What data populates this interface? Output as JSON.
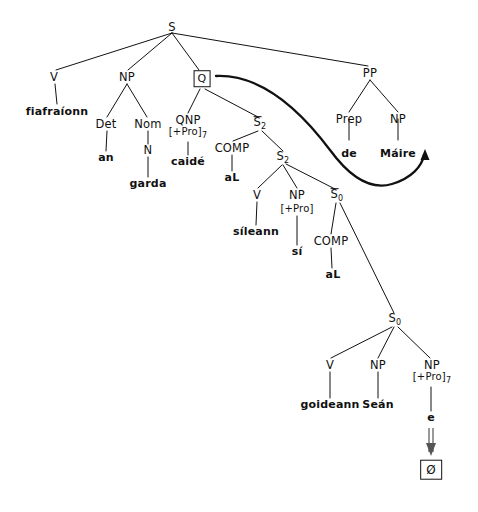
{
  "figure": {
    "type": "syntax-tree-diagram",
    "language": "Irish",
    "background_color": "#ffffff",
    "ink_color": "#111111",
    "width": 478,
    "height": 512
  },
  "nodes": {
    "root_s": {
      "label": "S",
      "x": 172,
      "y": 27
    },
    "v_top": {
      "label": "V",
      "x": 54,
      "y": 77
    },
    "fiafraionn": {
      "label": "fiafraíonn",
      "x": 57,
      "y": 112
    },
    "np_subj": {
      "label": "NP",
      "x": 127,
      "y": 77
    },
    "det": {
      "label": "Det",
      "x": 106,
      "y": 124
    },
    "an": {
      "label": "an",
      "x": 106,
      "y": 158
    },
    "nom": {
      "label": "Nom",
      "x": 148,
      "y": 124
    },
    "n": {
      "label": "N",
      "x": 148,
      "y": 150
    },
    "garda": {
      "label": "garda",
      "x": 148,
      "y": 184
    },
    "q_box": {
      "label": "Q",
      "x": 202,
      "y": 79
    },
    "qnp": {
      "label": "QNP",
      "x": 188,
      "y": 120
    },
    "qnp_feat": {
      "label": "[+Pro]",
      "index": "7",
      "x": 188,
      "y": 134
    },
    "caide": {
      "label": "caidé",
      "x": 188,
      "y": 162
    },
    "sbar2_upper": {
      "label": "S",
      "sub": "2",
      "overbar": true,
      "x": 260,
      "y": 124
    },
    "comp_upper": {
      "label": "COMP",
      "x": 232,
      "y": 148
    },
    "al_upper": {
      "label": "aL",
      "x": 232,
      "y": 178
    },
    "s2": {
      "label": "S",
      "sub": "2",
      "x": 283,
      "y": 158
    },
    "v_mid": {
      "label": "V",
      "x": 257,
      "y": 195
    },
    "sileann": {
      "label": "síleann",
      "x": 256,
      "y": 232
    },
    "np_si": {
      "label": "NP",
      "x": 297,
      "y": 195
    },
    "np_si_feat": {
      "label": "[+Pro]",
      "x": 297,
      "y": 209
    },
    "si": {
      "label": "sí",
      "x": 297,
      "y": 252
    },
    "sbar0": {
      "label": "S",
      "sub": "0",
      "overbar": true,
      "x": 337,
      "y": 196
    },
    "comp_lower": {
      "label": "COMP",
      "x": 331,
      "y": 241
    },
    "al_lower": {
      "label": "aL",
      "x": 333,
      "y": 275
    },
    "s0": {
      "label": "S",
      "sub": "0",
      "x": 395,
      "y": 320
    },
    "v_low": {
      "label": "V",
      "x": 330,
      "y": 365
    },
    "goideann": {
      "label": "goideann",
      "x": 330,
      "y": 405
    },
    "np_sean": {
      "label": "NP",
      "x": 378,
      "y": 365
    },
    "sean": {
      "label": "Seán",
      "x": 378,
      "y": 405
    },
    "np_trace": {
      "label": "NP",
      "x": 432,
      "y": 365
    },
    "np_trace_feat": {
      "label": "[+Pro]",
      "index": "7",
      "x": 432,
      "y": 379
    },
    "e_trace": {
      "label": "e",
      "x": 431,
      "y": 418
    },
    "null_box": {
      "label": "Ø",
      "x": 431,
      "y": 470
    }
  },
  "edges": [
    {
      "name": "s-to-v",
      "from": [
        172,
        33
      ],
      "to": [
        56,
        70
      ]
    },
    {
      "name": "s-to-np",
      "from": [
        172,
        33
      ],
      "to": [
        128,
        70
      ]
    },
    {
      "name": "s-to-q",
      "from": [
        172,
        33
      ],
      "to": [
        199,
        70
      ]
    },
    {
      "name": "s-to-pp",
      "from": [
        172,
        33
      ],
      "to": [
        368,
        66
      ]
    },
    {
      "name": "v-to-fiafraionn",
      "from": [
        55,
        84
      ],
      "to": [
        57,
        104
      ]
    },
    {
      "name": "np-to-det",
      "from": [
        127,
        84
      ],
      "to": [
        107,
        117
      ]
    },
    {
      "name": "np-to-nom",
      "from": [
        127,
        84
      ],
      "to": [
        147,
        117
      ]
    },
    {
      "name": "det-to-an",
      "from": [
        107,
        131
      ],
      "to": [
        106,
        151
      ]
    },
    {
      "name": "nom-to-n",
      "from": [
        148,
        131
      ],
      "to": [
        148,
        144
      ]
    },
    {
      "name": "n-to-garda",
      "from": [
        148,
        157
      ],
      "to": [
        148,
        177
      ]
    },
    {
      "name": "q-to-qnp",
      "from": [
        200,
        89
      ],
      "to": [
        188,
        113
      ]
    },
    {
      "name": "q-to-sbar2",
      "from": [
        205,
        89
      ],
      "to": [
        258,
        117
      ]
    },
    {
      "name": "qnp-to-caide",
      "from": [
        188,
        142
      ],
      "to": [
        188,
        155
      ]
    },
    {
      "name": "sbar2-to-comp",
      "from": [
        258,
        131
      ],
      "to": [
        233,
        141
      ]
    },
    {
      "name": "sbar2-to-s2",
      "from": [
        262,
        131
      ],
      "to": [
        283,
        151
      ]
    },
    {
      "name": "comp-to-al",
      "from": [
        232,
        155
      ],
      "to": [
        232,
        171
      ]
    },
    {
      "name": "s2-to-v",
      "from": [
        282,
        165
      ],
      "to": [
        258,
        188
      ]
    },
    {
      "name": "s2-to-np",
      "from": [
        283,
        165
      ],
      "to": [
        297,
        188
      ]
    },
    {
      "name": "s2-to-sbar0",
      "from": [
        286,
        164
      ],
      "to": [
        335,
        189
      ]
    },
    {
      "name": "v-to-sileann",
      "from": [
        257,
        202
      ],
      "to": [
        256,
        225
      ]
    },
    {
      "name": "np-to-si",
      "from": [
        297,
        216
      ],
      "to": [
        297,
        245
      ]
    },
    {
      "name": "sbar0-to-comp",
      "from": [
        336,
        203
      ],
      "to": [
        331,
        234
      ]
    },
    {
      "name": "sbar0-to-s0",
      "from": [
        340,
        203
      ],
      "to": [
        394,
        313
      ]
    },
    {
      "name": "comp-to-al",
      "from": [
        331,
        248
      ],
      "to": [
        332,
        268
      ]
    },
    {
      "name": "s0-to-v",
      "from": [
        392,
        327
      ],
      "to": [
        331,
        358
      ]
    },
    {
      "name": "s0-to-np-sean",
      "from": [
        394,
        327
      ],
      "to": [
        378,
        358
      ]
    },
    {
      "name": "s0-to-np-trace",
      "from": [
        398,
        327
      ],
      "to": [
        430,
        358
      ]
    },
    {
      "name": "v-to-goideann",
      "from": [
        330,
        372
      ],
      "to": [
        330,
        398
      ]
    },
    {
      "name": "np-to-sean",
      "from": [
        378,
        372
      ],
      "to": [
        378,
        398
      ]
    },
    {
      "name": "np-trace-to-e",
      "from": [
        431,
        387
      ],
      "to": [
        431,
        411
      ]
    },
    {
      "name": "pp-to-prep",
      "from": [
        370,
        80
      ],
      "to": [
        349,
        112
      ]
    },
    {
      "name": "pp-to-np",
      "from": [
        370,
        80
      ],
      "to": [
        398,
        112
      ]
    },
    {
      "name": "prep-to-de",
      "from": [
        349,
        119
      ],
      "to": [
        349,
        140
      ]
    },
    {
      "name": "np-to-maire",
      "from": [
        398,
        119
      ],
      "to": [
        398,
        140
      ]
    }
  ],
  "pp_branch": {
    "pp": {
      "label": "PP",
      "x": 370,
      "y": 73
    },
    "prep": {
      "label": "Prep",
      "x": 349,
      "y": 119
    },
    "de": {
      "label": "de",
      "x": 349,
      "y": 154
    },
    "np": {
      "label": "NP",
      "x": 398,
      "y": 119
    },
    "maire": {
      "label": "Máire",
      "x": 398,
      "y": 154
    }
  },
  "movement_arrow": {
    "name": "q-movement-curve",
    "description": "curved arrow from Q node sweeping right and down then back up to arrowhead",
    "path": "M 216 76 C 262 74 300 110 330 150 C 352 180 372 190 392 184 C 412 178 422 166 424 155",
    "arrow_tip": [
      425,
      150
    ]
  },
  "trace_arrow": {
    "name": "trace-deletion-double-arrow",
    "from": [
      431,
      428
    ],
    "to": [
      431,
      452
    ]
  }
}
